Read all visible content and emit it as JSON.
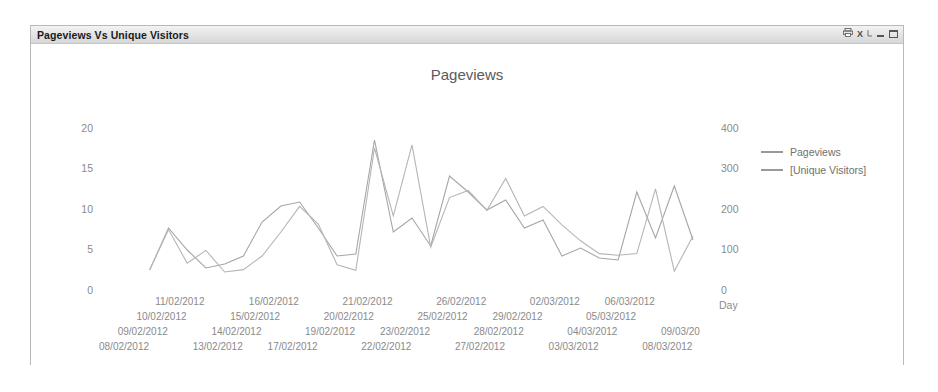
{
  "window": {
    "title": "Pageviews Vs Unique Visitors",
    "buttons": [
      {
        "name": "print-icon",
        "glyph": "⎙"
      },
      {
        "name": "excel-export-icon",
        "glyph": "X⟍"
      },
      {
        "name": "minimize-button",
        "glyph": ""
      },
      {
        "name": "maximize-button",
        "glyph": ""
      }
    ]
  },
  "legend": {
    "items": [
      {
        "label": "Pageviews",
        "color": "#9a9a9a"
      },
      {
        "label": "[Unique Visitors]",
        "color": "#9a9a9a"
      }
    ]
  },
  "chart_data": {
    "type": "line",
    "title": "Pageviews",
    "xlabel": "Day",
    "ylabel": "",
    "grid": false,
    "legend_position": "right",
    "categories": [
      "08/02/2012",
      "09/02/2012",
      "10/02/2012",
      "11/02/2012",
      "12/02/2012",
      "13/02/2012",
      "14/02/2012",
      "15/02/2012",
      "16/02/2012",
      "17/02/2012",
      "18/02/2012",
      "19/02/2012",
      "20/02/2012",
      "21/02/2012",
      "22/02/2012",
      "23/02/2012",
      "24/02/2012",
      "25/02/2012",
      "26/02/2012",
      "27/02/2012",
      "28/02/2012",
      "29/02/2012",
      "01/03/2012",
      "02/03/2012",
      "03/03/2012",
      "04/03/2012",
      "05/03/2012",
      "06/03/2012",
      "07/03/2012",
      "08/03/2012",
      "09/03/20"
    ],
    "x_tick_labels_shown": [
      "08/02/2012",
      "09/02/2012",
      "10/02/2012",
      "11/02/2012",
      "13/02/2012",
      "14/02/2012",
      "15/02/2012",
      "16/02/2012",
      "17/02/2012",
      "19/02/2012",
      "20/02/2012",
      "21/02/2012",
      "22/02/2012",
      "23/02/2012",
      "25/02/2012",
      "26/02/2012",
      "27/02/2012",
      "28/02/2012",
      "29/02/2012",
      "02/03/2012",
      "03/03/2012",
      "04/03/2012",
      "05/03/2012",
      "06/03/2012",
      "08/03/2012",
      "09/03/20"
    ],
    "axes": {
      "left": {
        "name": "[Unique Visitors]",
        "ticks": [
          0,
          5,
          10,
          15,
          20
        ],
        "ylim": [
          0,
          21.5
        ]
      },
      "right": {
        "name": "Pageviews",
        "ticks": [
          0,
          100,
          200,
          300,
          400
        ],
        "ylim": [
          0,
          430
        ]
      }
    },
    "series": [
      {
        "name": "Pageviews",
        "axis": "right",
        "color": "#a6a6a6",
        "values": [
          null,
          55,
          160,
          105,
          60,
          70,
          90,
          175,
          215,
          225,
          160,
          90,
          95,
          380,
          150,
          185,
          115,
          290,
          250,
          205,
          230,
          160,
          180,
          90,
          110,
          85,
          80,
          250,
          135,
          265,
          130
        ]
      },
      {
        "name": "[Unique Visitors]",
        "axis": "left",
        "color": "#b5b5b5",
        "values": [
          null,
          2.8,
          7.8,
          3.6,
          5.2,
          2.5,
          2.8,
          4.5,
          7.5,
          10.7,
          8.5,
          3.4,
          2.7,
          18.0,
          9.5,
          18.4,
          5.6,
          11.8,
          12.7,
          10.2,
          14.2,
          9.5,
          10.7,
          8.4,
          6.4,
          4.8,
          4.6,
          4.8,
          12.9,
          2.6,
          7.0
        ]
      }
    ]
  }
}
